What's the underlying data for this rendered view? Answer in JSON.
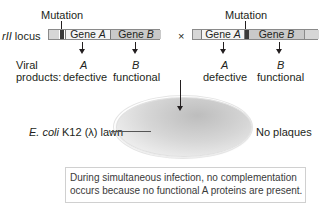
{
  "figure": {
    "left_locus": {
      "mutation_label": "Mutation",
      "locus_label_italic": "rII",
      "locus_label_rest": " locus",
      "gene_a_label": "Gene ",
      "gene_a_letter": "A",
      "gene_b_label": "Gene ",
      "gene_b_letter": "B",
      "mutation_position": "gene A (left end)",
      "product_a_letter": "A",
      "product_a_state": "defective",
      "product_b_letter": "B",
      "product_b_state": "functional"
    },
    "cross_symbol": "×",
    "right_locus": {
      "mutation_label": "Mutation",
      "gene_a_label": "Gene ",
      "gene_a_letter": "A",
      "gene_b_label": "Gene ",
      "gene_b_letter": "B",
      "mutation_position": "gene A (right end)",
      "product_a_letter": "A",
      "product_a_state": "defective",
      "product_b_letter": "B",
      "product_b_state": "functional"
    },
    "viral_products_label_line1": "Viral",
    "viral_products_label_line2": "products:",
    "plate_label_italic": "E. coli",
    "plate_label_rest": " K12 (λ) lawn",
    "plate_result": "No plaques",
    "note_line1": "During simultaneous infection, no complementation",
    "note_line2": "occurs because no functional A proteins are present."
  },
  "colors": {
    "gene_a_fill": "#f4f4f4",
    "gene_b_fill": "#c9c9c9",
    "mutation_fill": "#3a3a3a",
    "text": "#231f20"
  }
}
